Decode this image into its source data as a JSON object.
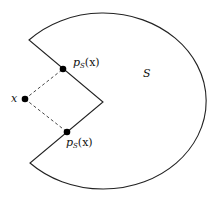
{
  "diagram": {
    "set_label": "S",
    "point_label": "x",
    "projection_top": {
      "p": "p",
      "sub": "S",
      "arg": "(x)"
    },
    "projection_bottom": {
      "p": "p",
      "sub": "S",
      "arg": "(x)"
    },
    "colors": {
      "stroke": "#222222",
      "fill": "#ffffff",
      "point": "#000000"
    }
  }
}
